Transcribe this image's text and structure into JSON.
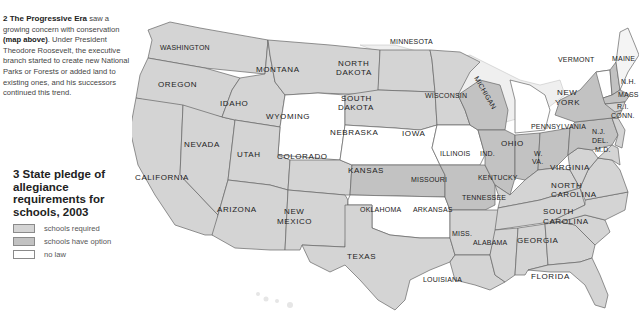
{
  "caption": {
    "number": "2",
    "title": "The Progressive Era",
    "text_1": " saw a growing concern with conservation ",
    "ref": "(map above)",
    "text_2": ". Under President Theodore Roosevelt, the executive branch started to create new National Parks or Forests or added land to existing ones, and his successors continued this trend."
  },
  "legend": {
    "title": "3 State pledge of allegiance requirements for schools, 2003",
    "items": [
      {
        "label": "schools required",
        "color": "#d4d4d4"
      },
      {
        "label": "schools have option",
        "color": "#c2c2c2"
      },
      {
        "label": "no law",
        "color": "#ffffff"
      }
    ]
  },
  "colors": {
    "required": "#d4d4d4",
    "option": "#c2c2c2",
    "none": "#ffffff",
    "water": "#efefef",
    "border": "#666666"
  },
  "states": {
    "washington": "WASHINGTON",
    "oregon": "OREGON",
    "california": "CALIFORNIA",
    "nevada": "NEVADA",
    "idaho": "IDAHO",
    "montana": "MONTANA",
    "wyoming": "WYOMING",
    "utah": "UTAH",
    "arizona": "ARIZONA",
    "colorado": "COLORADO",
    "new_mexico_1": "NEW",
    "new_mexico_2": "MEXICO",
    "north_dakota_1": "NORTH",
    "north_dakota_2": "DAKOTA",
    "south_dakota_1": "SOUTH",
    "south_dakota_2": "DAKOTA",
    "nebraska": "NEBRASKA",
    "kansas": "KANSAS",
    "oklahoma": "OKLAHOMA",
    "texas": "TEXAS",
    "minnesota": "MINNESOTA",
    "iowa": "IOWA",
    "missouri": "MISSOURI",
    "arkansas": "ARKANSAS",
    "louisiana": "LOUISIANA",
    "wisconsin": "WISCONSIN",
    "illinois": "ILLINOIS",
    "michigan": "MICHIGAN",
    "indiana": "IND.",
    "ohio": "OHIO",
    "kentucky": "KENTUCKY",
    "tennessee": "TENNESSEE",
    "mississippi": "MISS.",
    "alabama": "ALABAMA",
    "georgia": "GEORGIA",
    "florida": "FLORIDA",
    "south_carolina_1": "SOUTH",
    "south_carolina_2": "CAROLINA",
    "north_carolina_1": "NORTH",
    "north_carolina_2": "CAROLINA",
    "virginia": "VIRGINIA",
    "west_virginia_1": "W.",
    "west_virginia_2": "VA.",
    "pennsylvania": "PENNSYLVANIA",
    "new_york_1": "NEW",
    "new_york_2": "YORK",
    "vermont": "VERMONT",
    "maine": "MAINE",
    "new_hampshire": "N.H.",
    "massachusetts": "MASS",
    "rhode_island": "R.I.",
    "connecticut": "CONN.",
    "new_jersey": "N.J.",
    "delaware": "DEL.",
    "maryland": "M.D."
  }
}
